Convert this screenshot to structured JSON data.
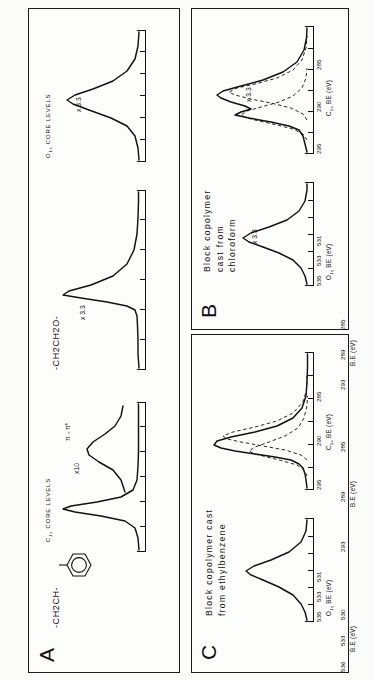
{
  "figure": {
    "type": "xps-spectra-figure",
    "orientation": "rotated-90-ccw",
    "background": "#fbfbfa",
    "ink": "#111111"
  },
  "panels": [
    {
      "letter": "A",
      "caption": "",
      "structures": [
        {
          "text": "-CH2CH-",
          "label": "styrene-repeat-unit",
          "has_phenyl_ring": true
        },
        {
          "text": "-CH2CH2O-",
          "label": "ethylene-oxide-repeat-unit",
          "has_phenyl_ring": false
        }
      ],
      "plots": [
        {
          "name": "c1s-core-levels",
          "core_label": "C1s CORE LEVELS",
          "axis_label": "B.E (eV)",
          "ticks": [
            "293",
            "289",
            "285"
          ],
          "scale_tag": "x10",
          "annotation": "π→π*"
        },
        {
          "name": "c1s-peo-core-levels",
          "core_label": "",
          "axis_label": "B.E (eV)",
          "ticks": [
            "293",
            "289",
            "285"
          ],
          "scale_tag": "x 3.3",
          "annotation": ""
        },
        {
          "name": "o1s-core-levels",
          "core_label": "O1s CORE LEVELS",
          "axis_label": "B.E (eV)",
          "ticks": [
            "536",
            "533",
            "530"
          ],
          "scale_tag": "x 3.3",
          "annotation": ""
        }
      ]
    },
    {
      "letter": "B",
      "caption": "Block copolymer\ncast from\nchloroform",
      "structures": [],
      "plots": [
        {
          "name": "c1s-spectrum",
          "core_label": "",
          "axis_label": "C1s BE (eV)",
          "ticks": [
            "295",
            "290",
            "285"
          ],
          "scale_tag": "x 3.3",
          "annotation": "",
          "has_fitted_components": true
        },
        {
          "name": "o1s-spectrum",
          "core_label": "",
          "axis_label": "O1s BE (eV)",
          "ticks": [
            "535",
            "533",
            "531"
          ],
          "scale_tag": "x 3.3",
          "annotation": "",
          "has_fitted_components": false
        }
      ]
    },
    {
      "letter": "C",
      "caption": "Block copolymer cast\nfrom ethylbenzene",
      "structures": [],
      "plots": [
        {
          "name": "c1s-spectrum",
          "core_label": "",
          "axis_label": "C1s BE (eV)",
          "ticks": [
            "295",
            "290",
            "285"
          ],
          "scale_tag": "",
          "annotation": "",
          "has_fitted_components": true
        },
        {
          "name": "o1s-spectrum",
          "core_label": "",
          "axis_label": "O1s BE (eV)",
          "ticks": [
            "535",
            "533",
            "531"
          ],
          "scale_tag": "",
          "annotation": "",
          "has_fitted_components": false
        }
      ]
    }
  ],
  "chart_data": {
    "type": "line",
    "xlabel": "Binding Energy (eV)",
    "ylabel": "Intensity (arb. units)",
    "grid": false,
    "legend": "none",
    "subplots": [
      {
        "panel": "A",
        "name": "polystyrene-c1s",
        "xlabel": "B.E (eV)",
        "xticks": [
          293,
          289,
          285
        ],
        "xlim": [
          296,
          283
        ],
        "scale": "x10",
        "peaks": [
          {
            "label": "C1s hydrocarbon",
            "center": 285.0,
            "rel_height": 1.0,
            "fwhm": 1.3
          },
          {
            "label": "π→π* shake-up",
            "center": 291.8,
            "rel_height": 0.09,
            "fwhm": 2.6
          }
        ]
      },
      {
        "panel": "A",
        "name": "poly-ethylene-oxide-c1s",
        "xlabel": "B.E (eV)",
        "xticks": [
          293,
          289,
          285
        ],
        "xlim": [
          296,
          283
        ],
        "scale": "x 3.3",
        "peaks": [
          {
            "label": "C-O ether carbon",
            "center": 286.5,
            "rel_height": 1.0,
            "fwhm": 1.5
          }
        ]
      },
      {
        "panel": "A",
        "name": "poly-ethylene-oxide-o1s",
        "xlabel": "B.E (eV)",
        "xticks": [
          536,
          533,
          530
        ],
        "xlim": [
          537,
          529
        ],
        "scale": "x 3.3",
        "peaks": [
          {
            "label": "O1s ether oxygen",
            "center": 533.0,
            "rel_height": 1.0,
            "fwhm": 1.7
          }
        ]
      },
      {
        "panel": "B",
        "name": "chloroform-cast-c1s",
        "xlabel": "C1s BE (eV)",
        "xticks": [
          295,
          290,
          285
        ],
        "xlim": [
          296,
          283
        ],
        "scale": "x 3.3",
        "peaks": [
          {
            "label": "C-C hydrocarbon",
            "center": 285.0,
            "rel_height": 1.0,
            "fwhm": 1.4
          },
          {
            "label": "C-O ether (fitted)",
            "center": 286.5,
            "rel_height": 0.62,
            "fwhm": 1.5
          }
        ]
      },
      {
        "panel": "B",
        "name": "chloroform-cast-o1s",
        "xlabel": "O1s BE (eV)",
        "xticks": [
          535,
          533,
          531
        ],
        "xlim": [
          536,
          530
        ],
        "scale": "x 3.3",
        "peaks": [
          {
            "label": "O1s ether oxygen",
            "center": 533.0,
            "rel_height": 1.0,
            "fwhm": 1.8
          }
        ]
      },
      {
        "panel": "C",
        "name": "ethylbenzene-cast-c1s",
        "xlabel": "C1s BE (eV)",
        "xticks": [
          295,
          290,
          285
        ],
        "xlim": [
          296,
          283
        ],
        "scale": "",
        "peaks": [
          {
            "label": "C-C hydrocarbon",
            "center": 285.0,
            "rel_height": 1.0,
            "fwhm": 1.3
          },
          {
            "label": "C-O ether (fitted)",
            "center": 286.5,
            "rel_height": 0.3,
            "fwhm": 1.5
          }
        ]
      },
      {
        "panel": "C",
        "name": "ethylbenzene-cast-o1s",
        "xlabel": "O1s BE (eV)",
        "xticks": [
          535,
          533,
          531
        ],
        "xlim": [
          536,
          530
        ],
        "scale": "",
        "peaks": [
          {
            "label": "O1s ether oxygen",
            "center": 533.0,
            "rel_height": 1.0,
            "fwhm": 1.9
          }
        ]
      }
    ]
  }
}
